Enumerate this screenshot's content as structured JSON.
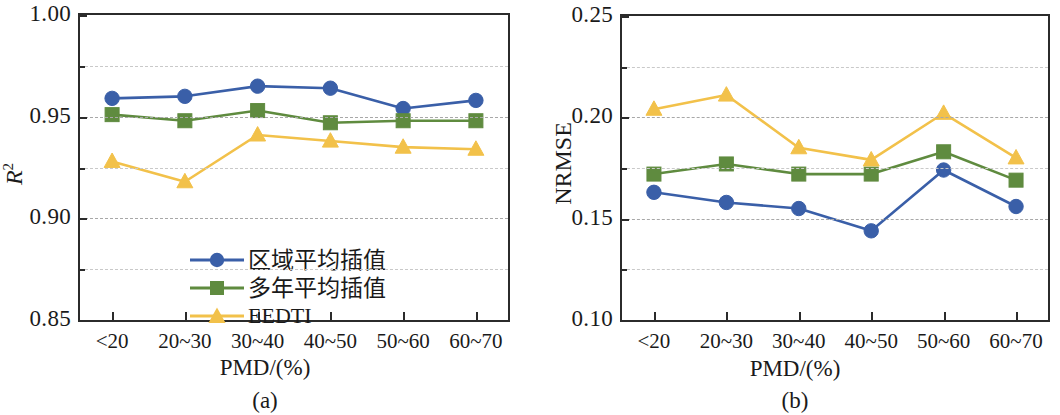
{
  "figure": {
    "panels": [
      {
        "tag": "(a)",
        "ytitle_html": "R2",
        "ytitle_base": "R",
        "ytitle_sup": "2",
        "xtitle": "PMD/(%)",
        "ylabels": [
          "1.00",
          "0.95",
          "0.90",
          "0.85"
        ],
        "yminor": [
          "0.975",
          "0.925",
          "0.875"
        ],
        "xlabels": [
          "<20",
          "20~30",
          "30~40",
          "40~50",
          "50~60",
          "60~70"
        ]
      },
      {
        "tag": "(b)",
        "ytitle_base": "NRMSE",
        "ytitle_sup": "",
        "xtitle": "PMD/(%)",
        "ylabels": [
          "0.25",
          "0.20",
          "0.15",
          "0.10"
        ],
        "yminor": [
          "0.225",
          "0.175",
          "0.125"
        ],
        "xlabels": [
          "<20",
          "20~30",
          "30~40",
          "40~50",
          "50~60",
          "60~70"
        ]
      }
    ],
    "legend": [
      {
        "label": "区域平均插值",
        "marker": "circle",
        "color": "#3a5fa8",
        "cjk": true
      },
      {
        "label": "多年平均插值",
        "marker": "square",
        "color": "#5f8b3f",
        "cjk": true
      },
      {
        "label": "EEDTI",
        "marker": "triangle",
        "color": "#f2c14a",
        "cjk": false
      }
    ]
  },
  "chart_data": [
    {
      "type": "line",
      "title": "(a)",
      "xlabel": "PMD/(%)",
      "ylabel": "R²",
      "categories": [
        "<20",
        "20~30",
        "30~40",
        "40~50",
        "50~60",
        "60~70"
      ],
      "ylim": [
        0.85,
        1.0
      ],
      "yticks": [
        0.85,
        0.9,
        0.95,
        1.0
      ],
      "yminor_ticks": [
        0.875,
        0.925,
        0.975
      ],
      "grid": true,
      "legend_position": "lower-left",
      "series": [
        {
          "name": "区域平均插值",
          "marker": "circle",
          "color": "#3a5fa8",
          "values": [
            0.959,
            0.96,
            0.965,
            0.964,
            0.954,
            0.958
          ]
        },
        {
          "name": "多年平均插值",
          "marker": "square",
          "color": "#5f8b3f",
          "values": [
            0.951,
            0.948,
            0.953,
            0.947,
            0.948,
            0.948
          ]
        },
        {
          "name": "EEDTI",
          "marker": "triangle",
          "color": "#f2c14a",
          "values": [
            0.928,
            0.918,
            0.941,
            0.938,
            0.935,
            0.934
          ]
        }
      ]
    },
    {
      "type": "line",
      "title": "(b)",
      "xlabel": "PMD/(%)",
      "ylabel": "NRMSE",
      "categories": [
        "<20",
        "20~30",
        "30~40",
        "40~50",
        "50~60",
        "60~70"
      ],
      "ylim": [
        0.1,
        0.25
      ],
      "yticks": [
        0.1,
        0.15,
        0.2,
        0.25
      ],
      "yminor_ticks": [
        0.125,
        0.175,
        0.225
      ],
      "grid": true,
      "legend_position": "none",
      "series": [
        {
          "name": "区域平均插值",
          "marker": "circle",
          "color": "#3a5fa8",
          "values": [
            0.163,
            0.158,
            0.155,
            0.144,
            0.174,
            0.156
          ]
        },
        {
          "name": "多年平均插值",
          "marker": "square",
          "color": "#5f8b3f",
          "values": [
            0.172,
            0.177,
            0.172,
            0.172,
            0.183,
            0.169
          ]
        },
        {
          "name": "EEDTI",
          "marker": "triangle",
          "color": "#f2c14a",
          "values": [
            0.204,
            0.211,
            0.185,
            0.179,
            0.202,
            0.18
          ]
        }
      ]
    }
  ]
}
